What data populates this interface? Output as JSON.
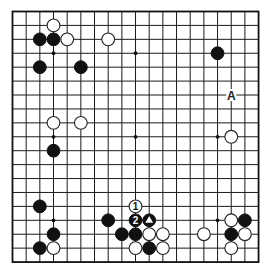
{
  "board": {
    "size": 19,
    "origin_x": 12.5,
    "origin_y": 11.5,
    "step_x": 13.67,
    "step_y": 13.92,
    "stone_radius": 6.4,
    "colors": {
      "background": "#ffffff",
      "line": "#1a1a1a",
      "black_stone": "#111111",
      "white_stone": "#ffffff"
    },
    "star_points": [
      [
        3,
        3
      ],
      [
        9,
        3
      ],
      [
        15,
        3
      ],
      [
        3,
        9
      ],
      [
        9,
        9
      ],
      [
        15,
        9
      ],
      [
        3,
        15
      ],
      [
        9,
        15
      ],
      [
        15,
        15
      ]
    ],
    "stones": [
      {
        "color": "white",
        "col": 3,
        "row": 1
      },
      {
        "color": "black",
        "col": 2,
        "row": 2
      },
      {
        "color": "black",
        "col": 3,
        "row": 2
      },
      {
        "color": "white",
        "col": 4,
        "row": 2
      },
      {
        "color": "white",
        "col": 7,
        "row": 2
      },
      {
        "color": "black",
        "col": 2,
        "row": 4
      },
      {
        "color": "black",
        "col": 5,
        "row": 4
      },
      {
        "color": "black",
        "col": 15,
        "row": 3
      },
      {
        "color": "white",
        "col": 3,
        "row": 8
      },
      {
        "color": "white",
        "col": 5,
        "row": 8
      },
      {
        "color": "black",
        "col": 3,
        "row": 10
      },
      {
        "color": "white",
        "col": 16,
        "row": 9
      },
      {
        "color": "black",
        "col": 2,
        "row": 14
      },
      {
        "color": "black",
        "col": 3,
        "row": 16
      },
      {
        "color": "black",
        "col": 2,
        "row": 17
      },
      {
        "color": "white",
        "col": 3,
        "row": 17
      },
      {
        "color": "white",
        "col": 9,
        "row": 14,
        "label": "1"
      },
      {
        "color": "black",
        "col": 9,
        "row": 15,
        "label": "2"
      },
      {
        "color": "black",
        "col": 10,
        "row": 15,
        "marker": "triangle"
      },
      {
        "color": "black",
        "col": 7,
        "row": 15
      },
      {
        "color": "black",
        "col": 8,
        "row": 16
      },
      {
        "color": "black",
        "col": 9,
        "row": 16
      },
      {
        "color": "white",
        "col": 10,
        "row": 16
      },
      {
        "color": "white",
        "col": 11,
        "row": 16
      },
      {
        "color": "white",
        "col": 9,
        "row": 17
      },
      {
        "color": "black",
        "col": 10,
        "row": 17
      },
      {
        "color": "white",
        "col": 11,
        "row": 17
      },
      {
        "color": "white",
        "col": 16,
        "row": 15
      },
      {
        "color": "black",
        "col": 17,
        "row": 15
      },
      {
        "color": "white",
        "col": 14,
        "row": 16
      },
      {
        "color": "black",
        "col": 16,
        "row": 16
      },
      {
        "color": "white",
        "col": 17,
        "row": 16
      },
      {
        "color": "white",
        "col": 16,
        "row": 17
      }
    ],
    "letter_labels": [
      {
        "text": "A",
        "col": 16,
        "row": 6
      }
    ]
  }
}
